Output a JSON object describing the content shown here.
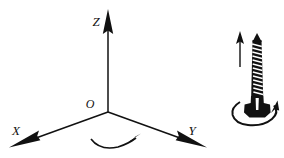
{
  "figure": {
    "background_color": "#ffffff",
    "ink_color": "#111111",
    "width": 284,
    "height": 158
  },
  "coordinate_system": {
    "name": "right-handed-cartesian-axes",
    "origin": {
      "label": "O",
      "x": 108,
      "y": 112
    },
    "axes": [
      {
        "key": "z",
        "label": "Z",
        "direction": "up",
        "label_x": 96,
        "label_y": 24,
        "tip_x": 108,
        "tip_y": 10
      },
      {
        "key": "x",
        "label": "X",
        "direction": "down-left",
        "label_x": 14,
        "label_y": 137,
        "tip_x": 10,
        "tip_y": 147
      },
      {
        "key": "y",
        "label": "Y",
        "direction": "down-right",
        "label_x": 190,
        "label_y": 137,
        "tip_x": 206,
        "tip_y": 146
      }
    ],
    "rotation_arc": {
      "name": "counterclockwise-rotation-arc",
      "description": "curved arrow sweeping about the Z axis near the origin",
      "arrow_direction": "toward-y-axis"
    }
  },
  "screw": {
    "name": "right-hand-screw",
    "thread_turns": 13,
    "translation_arrow": {
      "name": "upward-translation-arrow",
      "direction": "up",
      "x": 240,
      "top_y": 33,
      "bottom_y": 67
    },
    "rotation_ellipse": {
      "name": "screw-rotation-arrow",
      "direction": "counterclockwise-viewed-from-above",
      "center_x": 256,
      "center_y": 112,
      "radius_x": 23,
      "radius_y": 12
    }
  }
}
